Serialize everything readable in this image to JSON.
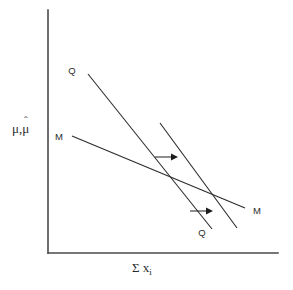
{
  "figure": {
    "domain": "diagram",
    "background_color": "#ffffff",
    "line_color": "#2b2b2b",
    "axis_color": "#4a4a4a",
    "width": 293,
    "height": 290
  },
  "axes": {
    "y_axis": {
      "label_mu": "μ",
      "label_comma": ",",
      "label_mu_hat_base": "μ",
      "label_mu_hat_accent": "ˆ",
      "label_plain": "μ,μ̂",
      "x_pos": 48,
      "y_top": 10,
      "y_bottom": 253
    },
    "x_axis": {
      "label_sigma": "Σ",
      "label_x": "x",
      "label_subscript": "i",
      "label_plain": "Σ xᵢ",
      "y_pos": 253,
      "x_left": 48,
      "x_right": 278
    }
  },
  "curves": [
    {
      "id": "q-curve-initial",
      "name": "Q",
      "label": "Q",
      "label_position": "upper-left",
      "label_x": 75,
      "label_y": 71,
      "x1": 88,
      "y1": 74,
      "x2": 212,
      "y2": 229
    },
    {
      "id": "q-curve-shifted",
      "name": "Q",
      "label": "Q",
      "label_position": "lower-right",
      "label_x": 201,
      "label_y": 233,
      "x1": 160,
      "y1": 123,
      "x2": 237,
      "y2": 228
    },
    {
      "id": "m-curve",
      "name": "M",
      "label_left": "M",
      "label_right": "M",
      "label_left_x": 60,
      "label_left_y": 138,
      "label_right_x": 254,
      "label_right_y": 213,
      "x1": 72,
      "y1": 136,
      "x2": 245,
      "y2": 208
    }
  ],
  "annotations": {
    "shift_arrows": [
      {
        "id": "shift-arrow-upper",
        "direction": "right",
        "x1": 155,
        "y1": 157,
        "x2": 176,
        "y2": 157
      },
      {
        "id": "shift-arrow-lower",
        "direction": "right",
        "x1": 190,
        "y1": 211,
        "x2": 211,
        "y2": 211
      }
    ]
  }
}
